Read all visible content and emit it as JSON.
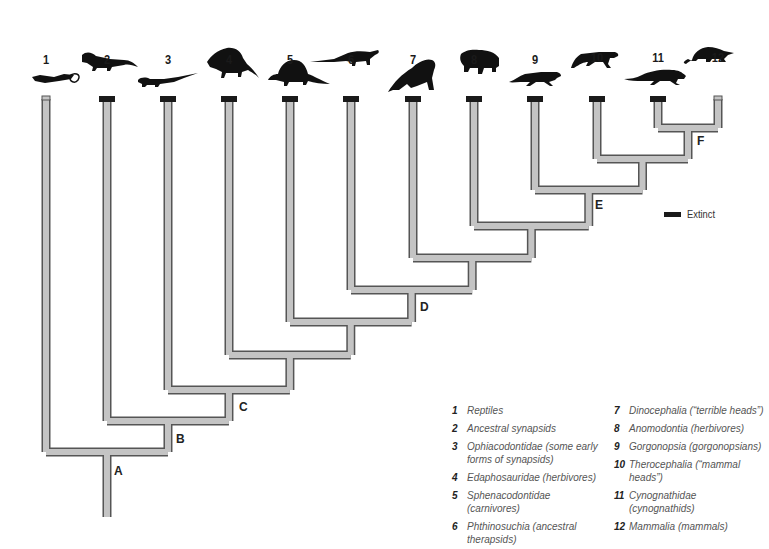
{
  "diagram": {
    "type": "cladogram",
    "colors": {
      "branch_fill": "#c4c4c4",
      "branch_stroke": "#555555",
      "extinct_marker": "#1a1a1a",
      "silhouette": "#111111"
    },
    "taxa": [
      {
        "num": "1",
        "x": 46,
        "extinct": false
      },
      {
        "num": "2",
        "x": 107,
        "extinct": true
      },
      {
        "num": "3",
        "x": 168,
        "extinct": true
      },
      {
        "num": "4",
        "x": 229,
        "extinct": true
      },
      {
        "num": "5",
        "x": 290,
        "extinct": true
      },
      {
        "num": "6",
        "x": 351,
        "extinct": true
      },
      {
        "num": "7",
        "x": 413,
        "extinct": true
      },
      {
        "num": "8",
        "x": 474,
        "extinct": true
      },
      {
        "num": "9",
        "x": 535,
        "extinct": true
      },
      {
        "num": "10",
        "x": 597,
        "extinct": true
      },
      {
        "num": "11",
        "x": 658,
        "extinct": true
      },
      {
        "num": "12",
        "x": 718,
        "extinct": false
      }
    ],
    "node_labels": [
      {
        "label": "A",
        "x": 114,
        "y": 464
      },
      {
        "label": "B",
        "x": 176,
        "y": 432
      },
      {
        "label": "C",
        "x": 239,
        "y": 400
      },
      {
        "label": "D",
        "x": 420,
        "y": 300
      },
      {
        "label": "E",
        "x": 595,
        "y": 198
      },
      {
        "label": "F",
        "x": 697,
        "y": 134
      }
    ],
    "legend": {
      "extinct_label": "Extinct"
    },
    "key_col1": [
      {
        "num": "1",
        "text": "Reptiles"
      },
      {
        "num": "2",
        "text": "Ancestral synapsids"
      },
      {
        "num": "3",
        "text": "Ophiacodontidae (some early forms of synapsids)"
      },
      {
        "num": "4",
        "text": "Edaphosauridae (herbivores)"
      },
      {
        "num": "5",
        "text": "Sphenacodontidae (carnivores)"
      },
      {
        "num": "6",
        "text": "Phthinosuchia (ancestral therapsids)"
      }
    ],
    "key_col2": [
      {
        "num": "7",
        "text": "Dinocephalia (“terrible heads”)"
      },
      {
        "num": "8",
        "text": "Anomodontia (herbivores)"
      },
      {
        "num": "9",
        "text": "Gorgonopsia (gorgonopsians)"
      },
      {
        "num": "10",
        "text": "Therocephalia (“mammal heads”)"
      },
      {
        "num": "11",
        "text": "Cynognathidae (cynognathids)"
      },
      {
        "num": "12",
        "text": "Mammalia (mammals)"
      }
    ]
  }
}
